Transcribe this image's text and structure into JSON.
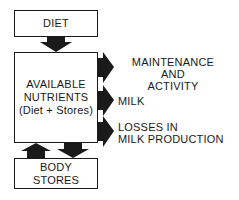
{
  "diagram": {
    "title": "",
    "boxes": {
      "diet": {
        "label": "DIET"
      },
      "available_nutrients": {
        "line1": "AVAILABLE",
        "line2": "NUTRIENTS",
        "line3": "(Diet + Stores)"
      },
      "body_stores": {
        "line1": "BODY",
        "line2": "STORES"
      }
    },
    "outputs": [
      {
        "line1": "MAINTENANCE",
        "line2": "AND",
        "line3": "ACTIVITY"
      },
      {
        "line1": "MILK"
      },
      {
        "line1": "LOSSES IN",
        "line2": "MILK PRODUCTION"
      }
    ],
    "edges": [
      {
        "from": "DIET",
        "to": "AVAILABLE NUTRIENTS"
      },
      {
        "from": "AVAILABLE NUTRIENTS",
        "to": "MAINTENANCE AND ACTIVITY"
      },
      {
        "from": "AVAILABLE NUTRIENTS",
        "to": "MILK"
      },
      {
        "from": "AVAILABLE NUTRIENTS",
        "to": "LOSSES IN MILK PRODUCTION"
      },
      {
        "from": "BODY STORES",
        "to": "AVAILABLE NUTRIENTS"
      },
      {
        "from": "AVAILABLE NUTRIENTS",
        "to": "BODY STORES"
      }
    ],
    "colors": {
      "ink": "#1a1a1a",
      "background": "#ffffff"
    }
  }
}
